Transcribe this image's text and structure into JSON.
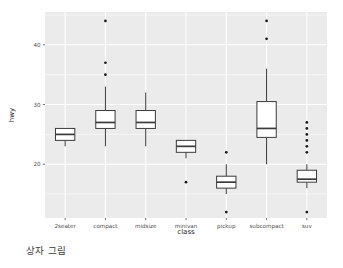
{
  "caption": "상자 그림",
  "colors": {
    "panel_background": "#ebebeb",
    "gridline": "#ffffff",
    "box_fill": "#ffffff",
    "box_stroke": "#3b3b3b",
    "outlier": "#1a1a1a",
    "axis_text": "#4d4d4d",
    "axis_title": "#1a1a1a",
    "figure_background": "#ffffff"
  },
  "chart_data": {
    "type": "box",
    "title": "",
    "subtitle": "",
    "xlabel": "class",
    "ylabel": "hwy",
    "categories": [
      "2seater",
      "compact",
      "midsize",
      "minivan",
      "pickup",
      "subcompact",
      "suv"
    ],
    "xtick_labels": [
      "2seater",
      "compact",
      "midsize",
      "minivan",
      "pickup",
      "subcompact",
      "suv"
    ],
    "ytick_labels": [
      "20",
      "30",
      "40"
    ],
    "yticks": [
      20,
      30,
      40
    ],
    "ylim": [
      11.0,
      45.5
    ],
    "y_minor_ticks": [
      15,
      25,
      35,
      45
    ],
    "grid": true,
    "legend": "none",
    "boxes": [
      {
        "category": "2seater",
        "min_whisker": 23,
        "q1": 24,
        "median": 25,
        "q3": 26,
        "max_whisker": 26,
        "outliers": []
      },
      {
        "category": "compact",
        "min_whisker": 23,
        "q1": 26,
        "median": 27,
        "q3": 29,
        "max_whisker": 33,
        "outliers": [
          35,
          37,
          44
        ]
      },
      {
        "category": "midsize",
        "min_whisker": 23,
        "q1": 26,
        "median": 27,
        "q3": 29,
        "max_whisker": 32,
        "outliers": []
      },
      {
        "category": "minivan",
        "min_whisker": 21,
        "q1": 22,
        "median": 23,
        "q3": 24,
        "max_whisker": 24,
        "outliers": [
          17
        ]
      },
      {
        "category": "pickup",
        "min_whisker": 15,
        "q1": 16,
        "median": 17,
        "q3": 18,
        "max_whisker": 20,
        "outliers": [
          22,
          12
        ]
      },
      {
        "category": "subcompact",
        "min_whisker": 20,
        "q1": 24.5,
        "median": 26,
        "q3": 30.5,
        "max_whisker": 36,
        "outliers": [
          41,
          44
        ]
      },
      {
        "category": "suv",
        "min_whisker": 16,
        "q1": 17,
        "median": 17.5,
        "q3": 19,
        "max_whisker": 20,
        "outliers": [
          22,
          23,
          24,
          25,
          26,
          27,
          12
        ]
      }
    ]
  }
}
